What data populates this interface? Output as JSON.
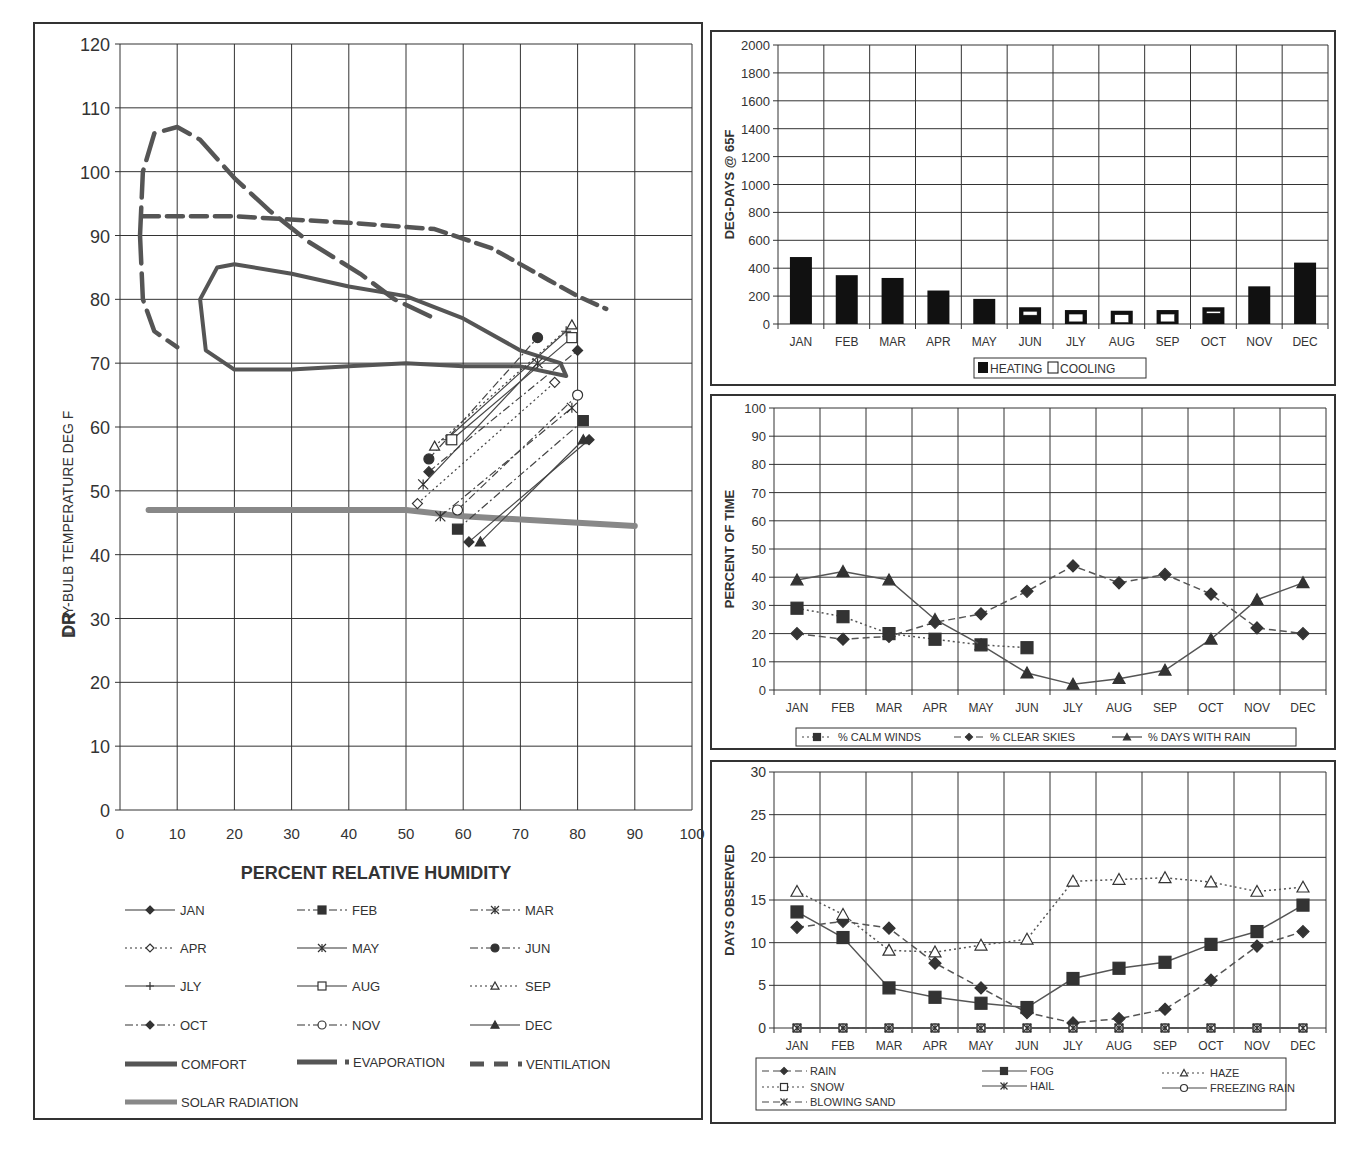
{
  "months": [
    "JAN",
    "FEB",
    "MAR",
    "APR",
    "MAY",
    "JUN",
    "JLY",
    "AUG",
    "SEP",
    "OCT",
    "NOV",
    "DEC"
  ],
  "chart_data": [
    {
      "id": "bioclimatic",
      "type": "line",
      "title": "",
      "xlabel": "PERCENT RELATIVE HUMIDITY",
      "ylabel": "DRY-BULB TEMPERATURE DEG F",
      "ylabel_prefix": "DR",
      "xlim": [
        0,
        100
      ],
      "ylim": [
        0,
        120
      ],
      "x_ticks": [
        0,
        10,
        20,
        30,
        40,
        50,
        60,
        70,
        80,
        90,
        100
      ],
      "y_ticks": [
        0,
        10,
        20,
        30,
        40,
        50,
        60,
        70,
        80,
        90,
        100,
        110,
        120
      ],
      "grid": true,
      "legend_position": "bottom",
      "series": [
        {
          "name": "JAN",
          "style": "solid",
          "marker": "diamond-filled",
          "points": [
            [
              61,
              42
            ],
            [
              82,
              58
            ]
          ]
        },
        {
          "name": "FEB",
          "style": "dashdot",
          "marker": "square-filled",
          "points": [
            [
              59,
              44
            ],
            [
              81,
              61
            ]
          ]
        },
        {
          "name": "MAR",
          "style": "dashdot",
          "marker": "star",
          "points": [
            [
              56,
              46
            ],
            [
              79,
              63
            ]
          ]
        },
        {
          "name": "APR",
          "style": "dotted",
          "marker": "diamond-open",
          "points": [
            [
              52,
              48
            ],
            [
              76,
              67
            ]
          ]
        },
        {
          "name": "MAY",
          "style": "solid",
          "marker": "star",
          "points": [
            [
              53,
              51
            ],
            [
              73,
              70
            ]
          ]
        },
        {
          "name": "JUN",
          "style": "dashdot",
          "marker": "circle-filled",
          "points": [
            [
              54,
              55
            ],
            [
              73,
              74
            ]
          ]
        },
        {
          "name": "JLY",
          "style": "solid",
          "marker": "plus",
          "points": [
            [
              57,
              58
            ],
            [
              78,
              75
            ]
          ]
        },
        {
          "name": "AUG",
          "style": "solid",
          "marker": "square-open",
          "points": [
            [
              58,
              58
            ],
            [
              79,
              74
            ]
          ]
        },
        {
          "name": "SEP",
          "style": "dotted",
          "marker": "triangle-open",
          "points": [
            [
              55,
              57
            ],
            [
              79,
              76
            ]
          ]
        },
        {
          "name": "OCT",
          "style": "dashdot",
          "marker": "diamond-filled",
          "points": [
            [
              54,
              53
            ],
            [
              80,
              72
            ]
          ]
        },
        {
          "name": "NOV",
          "style": "dashdot",
          "marker": "circle-open",
          "points": [
            [
              59,
              47
            ],
            [
              80,
              65
            ]
          ]
        },
        {
          "name": "DEC",
          "style": "solid",
          "marker": "triangle-filled",
          "points": [
            [
              63,
              42
            ],
            [
              81,
              58
            ]
          ]
        }
      ],
      "zones": [
        {
          "name": "COMFORT",
          "style": "thick-solid",
          "points": [
            [
              20,
              85.5
            ],
            [
              30,
              84
            ],
            [
              40,
              82
            ],
            [
              50,
              80.5
            ],
            [
              60,
              77
            ],
            [
              70,
              72
            ],
            [
              77,
              70
            ],
            [
              78,
              68
            ],
            [
              70,
              69.5
            ],
            [
              60,
              69.5
            ],
            [
              50,
              70
            ],
            [
              40,
              69.5
            ],
            [
              30,
              69
            ],
            [
              20,
              69
            ],
            [
              15,
              72
            ],
            [
              14,
              80
            ],
            [
              17,
              85
            ],
            [
              20,
              85.5
            ]
          ]
        },
        {
          "name": "EVAPORATION",
          "style": "thick-dash",
          "points": [
            [
              3.5,
              90
            ],
            [
              4,
              100
            ],
            [
              6,
              106
            ],
            [
              10,
              107
            ],
            [
              14,
              105
            ],
            [
              20,
              99
            ],
            [
              26,
              94
            ],
            [
              33,
              89
            ],
            [
              42,
              84
            ],
            [
              48,
              80
            ],
            [
              55,
              77
            ]
          ]
        },
        {
          "name": "EVAPORATION-lower",
          "style": "thick-dash",
          "points": [
            [
              3.5,
              90
            ],
            [
              4,
              80
            ],
            [
              6,
              75
            ],
            [
              10,
              72.5
            ]
          ]
        },
        {
          "name": "VENTILATION",
          "style": "thick-dash-short",
          "points": [
            [
              4,
              93
            ],
            [
              20,
              93
            ],
            [
              40,
              92
            ],
            [
              55,
              91
            ],
            [
              65,
              88
            ],
            [
              75,
              83
            ],
            [
              80,
              80.5
            ],
            [
              85,
              78.5
            ]
          ]
        },
        {
          "name": "SOLAR RADIATION",
          "style": "thick-gray",
          "points": [
            [
              5,
              47
            ],
            [
              50,
              47
            ],
            [
              60,
              46
            ],
            [
              90,
              44.5
            ]
          ]
        }
      ],
      "legend": [
        "JAN",
        "FEB",
        "MAR",
        "APR",
        "MAY",
        "JUN",
        "JLY",
        "AUG",
        "SEP",
        "OCT",
        "NOV",
        "DEC",
        "COMFORT",
        "EVAPORATION",
        "VENTILATION",
        "SOLAR RADIATION"
      ]
    },
    {
      "id": "degree_days",
      "type": "bar",
      "title": "",
      "xlabel": "",
      "ylabel": "DEG-DAYS @ 65F",
      "ylim": [
        0,
        2000
      ],
      "y_ticks": [
        0,
        200,
        400,
        600,
        800,
        1000,
        1200,
        1400,
        1600,
        1800,
        2000
      ],
      "categories": [
        "JAN",
        "FEB",
        "MAR",
        "APR",
        "MAY",
        "JUN",
        "JLY",
        "AUG",
        "SEP",
        "OCT",
        "NOV",
        "DEC"
      ],
      "series": [
        {
          "name": "HEATING",
          "values": [
            480,
            350,
            330,
            240,
            180,
            120,
            100,
            95,
            100,
            120,
            270,
            440
          ]
        },
        {
          "name": "COOLING",
          "values": [
            0,
            0,
            0,
            0,
            0,
            40,
            80,
            80,
            80,
            10,
            0,
            0
          ]
        }
      ],
      "grid": true,
      "legend_position": "bottom"
    },
    {
      "id": "percent_time",
      "type": "line",
      "title": "",
      "xlabel": "",
      "ylabel": "PERCENT OF TIME",
      "ylim": [
        0,
        100
      ],
      "y_ticks": [
        0,
        10,
        20,
        30,
        40,
        50,
        60,
        70,
        80,
        90,
        100
      ],
      "categories": [
        "JAN",
        "FEB",
        "MAR",
        "APR",
        "MAY",
        "JUN",
        "JLY",
        "AUG",
        "SEP",
        "OCT",
        "NOV",
        "DEC"
      ],
      "series": [
        {
          "name": "% CALM WINDS",
          "style": "dotted",
          "marker": "square",
          "values": [
            29,
            26,
            20,
            18,
            16,
            15,
            null,
            null,
            null,
            null,
            null,
            null
          ]
        },
        {
          "name": "% CLEAR SKIES",
          "style": "dashed",
          "marker": "diamond",
          "values": [
            20,
            18,
            19,
            24,
            27,
            35,
            44,
            38,
            41,
            34,
            22,
            20
          ]
        },
        {
          "name": "% DAYS WITH RAIN",
          "style": "solid",
          "marker": "triangle",
          "values": [
            39,
            42,
            39,
            25,
            16,
            6,
            2,
            4,
            7,
            18,
            32,
            38
          ]
        }
      ],
      "grid": true,
      "legend_position": "bottom"
    },
    {
      "id": "days_observed",
      "type": "line",
      "title": "",
      "xlabel": "",
      "ylabel": "DAYS OBSERVED",
      "ylim": [
        0,
        30
      ],
      "y_ticks": [
        0,
        5,
        10,
        15,
        20,
        25,
        30
      ],
      "categories": [
        "JAN",
        "FEB",
        "MAR",
        "APR",
        "MAY",
        "JUN",
        "JLY",
        "AUG",
        "SEP",
        "OCT",
        "NOV",
        "DEC"
      ],
      "series": [
        {
          "name": "RAIN",
          "style": "dashed",
          "marker": "diamond",
          "values": [
            11.8,
            12.5,
            11.7,
            7.6,
            4.7,
            1.8,
            0.6,
            1.1,
            2.2,
            5.6,
            9.6,
            11.3
          ]
        },
        {
          "name": "FOG",
          "style": "solid",
          "marker": "square",
          "values": [
            13.6,
            10.6,
            4.7,
            3.6,
            2.9,
            2.4,
            5.8,
            7.0,
            7.7,
            9.8,
            11.3,
            14.4
          ]
        },
        {
          "name": "HAZE",
          "style": "dotted",
          "marker": "triangle-open",
          "values": [
            16.0,
            13.3,
            9.1,
            8.9,
            9.7,
            10.4,
            17.2,
            17.4,
            17.6,
            17.1,
            16.0,
            16.5
          ]
        },
        {
          "name": "SNOW",
          "style": "dotted",
          "marker": "square-open",
          "values": [
            0,
            0,
            0,
            0,
            0,
            0,
            0,
            0,
            0,
            0,
            0,
            0
          ]
        },
        {
          "name": "HAIL",
          "style": "solid",
          "marker": "star",
          "values": [
            0,
            0,
            0,
            0,
            0,
            0,
            0,
            0,
            0,
            0,
            0,
            0
          ]
        },
        {
          "name": "FREEZING RAIN",
          "style": "solid",
          "marker": "circle-open",
          "values": [
            0,
            0,
            0,
            0,
            0,
            0,
            0,
            0,
            0,
            0,
            0,
            0
          ]
        },
        {
          "name": "BLOWING SAND",
          "style": "dashed",
          "marker": "star",
          "values": [
            0,
            0,
            0,
            0,
            0,
            0,
            0,
            0,
            0,
            0,
            0,
            0
          ]
        }
      ],
      "grid": true,
      "legend_position": "bottom"
    }
  ],
  "labels": {
    "bio_xlabel": "PERCENT RELATIVE HUMIDITY",
    "bio_ylabel": "DRY-BULB TEMPERATURE DEG F",
    "bio_ylabel_prefix": "DR",
    "dd_ylabel": "DEG-DAYS @ 65F",
    "pt_ylabel": "PERCENT OF TIME",
    "do_ylabel": "DAYS OBSERVED"
  }
}
